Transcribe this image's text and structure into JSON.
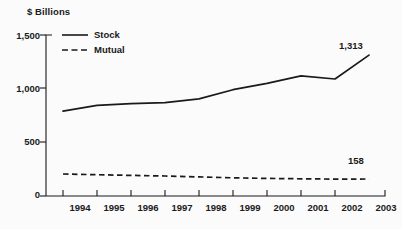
{
  "chart_data": {
    "type": "line",
    "title": "",
    "ylabel": "$ Billions",
    "xlabel": "",
    "ylim": [
      0,
      1500
    ],
    "yticks": [
      "0",
      "500",
      "1,000",
      "1,500"
    ],
    "ytick_values": [
      0,
      500,
      1000,
      1500
    ],
    "grid": false,
    "legend_position": "top-left",
    "categories": [
      "1994",
      "1995",
      "1996",
      "1997",
      "1998",
      "1999",
      "2000",
      "2001",
      "2002",
      "2003"
    ],
    "series": [
      {
        "name": "Stock",
        "style": "solid",
        "color": "#1a1a1a",
        "values": [
          790,
          845,
          860,
          870,
          905,
          990,
          1050,
          1120,
          1090,
          1313
        ],
        "end_label": "1,313"
      },
      {
        "name": "Mutual",
        "style": "dashed",
        "color": "#1a1a1a",
        "values": [
          205,
          198,
          192,
          186,
          178,
          170,
          164,
          160,
          157,
          158
        ],
        "end_label": "158"
      }
    ],
    "annotations": [
      {
        "text": "1,313",
        "series": "Stock"
      },
      {
        "text": "158",
        "series": "Mutual"
      }
    ]
  },
  "legend": {
    "items": [
      {
        "label": "Stock",
        "style": "solid"
      },
      {
        "label": "Mutual",
        "style": "dashed"
      }
    ]
  },
  "axes": {
    "y_title": "$ Billions",
    "y_labels": [
      "1,500",
      "1,000",
      "500",
      "0"
    ],
    "x_labels": [
      "1994",
      "1995",
      "1996",
      "1997",
      "1998",
      "1999",
      "2000",
      "2001",
      "2002",
      "2003"
    ]
  }
}
